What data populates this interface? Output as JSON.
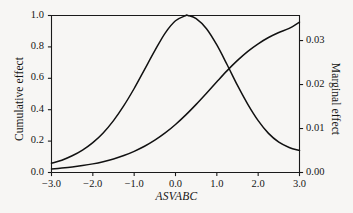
{
  "chart_data": {
    "type": "line",
    "title": "",
    "xlabel": "ASVABC",
    "ylabel": "Cumulative effect",
    "y2label": "Marginal effect",
    "xlim": [
      -3.0,
      3.0
    ],
    "ylim": [
      0.0,
      1.0
    ],
    "y2lim": [
      0.0,
      0.0357
    ],
    "grid": false,
    "legend": "none",
    "xticks": [
      "-3.0",
      "-2.0",
      "-1.0",
      "0.0",
      "1.0",
      "2.0",
      "3.0"
    ],
    "xtick_values": [
      -3.0,
      -2.0,
      -1.0,
      0.0,
      1.0,
      2.0,
      3.0
    ],
    "yticks": [
      "0.0",
      "0.2",
      "0.4",
      "0.6",
      "0.8",
      "1.0"
    ],
    "ytick_values": [
      0.0,
      0.2,
      0.4,
      0.6,
      0.8,
      1.0
    ],
    "y2ticks": [
      "0.00",
      "0.01",
      "0.02",
      "0.03"
    ],
    "y2tick_values": [
      0.0,
      0.01,
      0.02,
      0.03
    ],
    "series": [
      {
        "name": "Cumulative effect",
        "axis": "left",
        "color": "#111111",
        "x": [
          -3.0,
          -2.75,
          -2.5,
          -2.25,
          -2.0,
          -1.75,
          -1.5,
          -1.25,
          -1.0,
          -0.75,
          -0.5,
          -0.25,
          0.0,
          0.25,
          0.5,
          0.75,
          1.0,
          1.25,
          1.5,
          1.75,
          2.0,
          2.25,
          2.5,
          2.75,
          3.0
        ],
        "values": [
          0.022,
          0.028,
          0.035,
          0.044,
          0.055,
          0.069,
          0.086,
          0.108,
          0.135,
          0.167,
          0.206,
          0.252,
          0.306,
          0.367,
          0.434,
          0.505,
          0.578,
          0.649,
          0.714,
          0.772,
          0.82,
          0.86,
          0.892,
          0.918,
          0.958
        ]
      },
      {
        "name": "Marginal effect",
        "axis": "right",
        "color": "#111111",
        "x": [
          -3.0,
          -2.75,
          -2.5,
          -2.25,
          -2.0,
          -1.75,
          -1.5,
          -1.25,
          -1.0,
          -0.75,
          -0.5,
          -0.25,
          0.0,
          0.25,
          0.3,
          0.5,
          0.75,
          1.0,
          1.25,
          1.5,
          1.75,
          2.0,
          2.25,
          2.5,
          2.75,
          3.0
        ],
        "values": [
          0.0021,
          0.0028,
          0.0038,
          0.0051,
          0.0068,
          0.009,
          0.0118,
          0.0152,
          0.0191,
          0.0234,
          0.0277,
          0.0317,
          0.0345,
          0.0357,
          0.0357,
          0.035,
          0.0327,
          0.029,
          0.0245,
          0.0198,
          0.0155,
          0.0118,
          0.0089,
          0.0069,
          0.0057,
          0.005
        ]
      }
    ],
    "annotations": []
  },
  "axes": {
    "left_title": "Cumulative effect",
    "right_title": "Marginal effect",
    "bottom_title": "ASVABC"
  },
  "style": {
    "background": "#f7f6f4",
    "axis_color": "#1a1a1a",
    "line_color": "#111111"
  }
}
